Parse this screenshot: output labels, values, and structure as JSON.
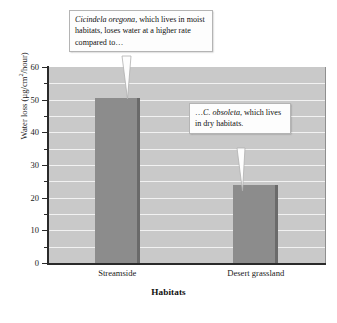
{
  "chart_data": {
    "type": "bar",
    "title": "",
    "categories": [
      "Streamside",
      "Desert grassland"
    ],
    "values": [
      50.5,
      24
    ],
    "xlabel": "Habitats",
    "ylabel": "Water loss (µg/cm²/hour)",
    "ylabel_parts": {
      "prefix": "Water loss (µg/cm",
      "superscript": "2",
      "suffix": "/hour)"
    },
    "ylim": [
      0,
      60
    ],
    "ytick_labels": [
      "0",
      "10",
      "20",
      "30",
      "40",
      "50",
      "60"
    ],
    "ytick_values": [
      0,
      10,
      20,
      30,
      40,
      50,
      60
    ],
    "minor_tick_interval": 5,
    "grid": "horizontal-every-5",
    "legend": "none",
    "series": [
      {
        "name": "Water loss",
        "values": [
          50.5,
          24
        ],
        "color": "#8c8c8c",
        "edge_color": "#6a6a6a"
      }
    ],
    "plot_background": "#c9c9c9",
    "gridline_color": "#f2f2f2",
    "annotations": [
      {
        "id": "callout-streamside",
        "italic_text": "Cicindela oregona",
        "rest_text": ", which lives in moist habitats, loses water at a higher rate compared to…",
        "points_to": "Streamside"
      },
      {
        "id": "callout-desert",
        "lead_text": "…",
        "italic_text": "C. obsoleta",
        "rest_text": ", which lives in dry habitats.",
        "points_to": "Desert grassland"
      }
    ]
  }
}
